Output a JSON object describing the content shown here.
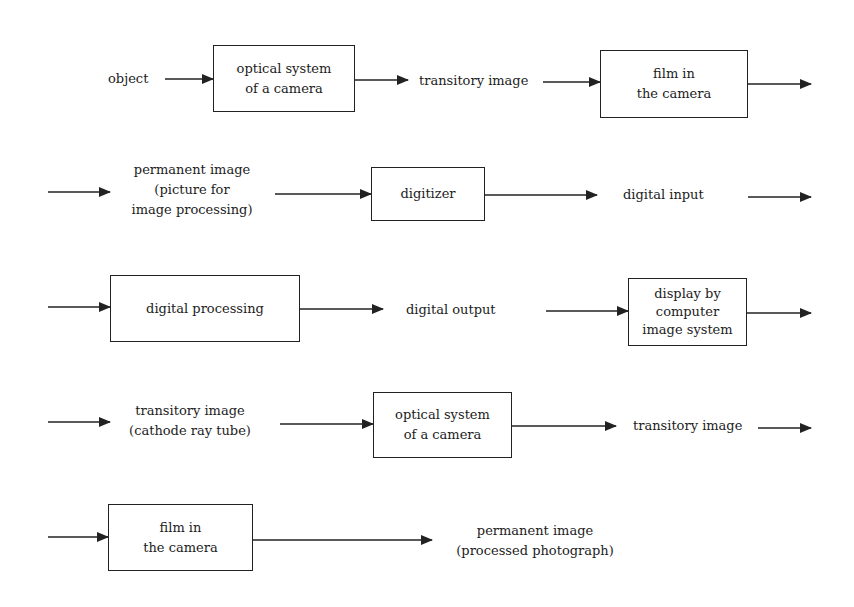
{
  "diagram": {
    "type": "flowchart",
    "rows": [
      {
        "row": 1,
        "nodes": [
          {
            "id": "object",
            "kind": "label",
            "lines": [
              "object"
            ]
          },
          {
            "id": "optical1",
            "kind": "box",
            "lines": [
              "optical system",
              "of a camera"
            ]
          },
          {
            "id": "transitory1",
            "kind": "label",
            "lines": [
              "transitory image"
            ]
          },
          {
            "id": "film1",
            "kind": "box",
            "lines": [
              "film in",
              "the camera"
            ]
          }
        ]
      },
      {
        "row": 2,
        "nodes": [
          {
            "id": "permanent1",
            "kind": "label",
            "lines": [
              "permanent image",
              "(picture for",
              "image processing)"
            ]
          },
          {
            "id": "digitizer",
            "kind": "box",
            "lines": [
              "digitizer"
            ]
          },
          {
            "id": "digital_input",
            "kind": "label",
            "lines": [
              "digital input"
            ]
          }
        ]
      },
      {
        "row": 3,
        "nodes": [
          {
            "id": "digital_processing",
            "kind": "box",
            "lines": [
              "digital processing"
            ]
          },
          {
            "id": "digital_output",
            "kind": "label",
            "lines": [
              "digital output"
            ]
          },
          {
            "id": "display",
            "kind": "box",
            "lines": [
              "display by",
              "computer",
              "image system"
            ]
          }
        ]
      },
      {
        "row": 4,
        "nodes": [
          {
            "id": "transitory2",
            "kind": "label",
            "lines": [
              "transitory image",
              "(cathode ray tube)"
            ]
          },
          {
            "id": "optical2",
            "kind": "box",
            "lines": [
              "optical system",
              "of a camera"
            ]
          },
          {
            "id": "transitory3",
            "kind": "label",
            "lines": [
              "transitory image"
            ]
          }
        ]
      },
      {
        "row": 5,
        "nodes": [
          {
            "id": "film2",
            "kind": "box",
            "lines": [
              "film in",
              "the camera"
            ]
          },
          {
            "id": "permanent2",
            "kind": "label",
            "lines": [
              "permanent image",
              "(processed photograph)"
            ]
          }
        ]
      }
    ],
    "edges": [
      [
        "object",
        "optical1"
      ],
      [
        "optical1",
        "transitory1"
      ],
      [
        "transitory1",
        "film1"
      ],
      [
        "film1",
        "permanent1"
      ],
      [
        "permanent1",
        "digitizer"
      ],
      [
        "digitizer",
        "digital_input"
      ],
      [
        "digital_input",
        "digital_processing"
      ],
      [
        "digital_processing",
        "digital_output"
      ],
      [
        "digital_output",
        "display"
      ],
      [
        "display",
        "transitory2"
      ],
      [
        "transitory2",
        "optical2"
      ],
      [
        "optical2",
        "transitory3"
      ],
      [
        "transitory3",
        "film2"
      ],
      [
        "film2",
        "permanent2"
      ]
    ]
  },
  "text": {
    "object": "object",
    "optical1_l1": "optical system",
    "optical1_l2": "of a camera",
    "transitory1": "transitory image",
    "film1_l1": "film in",
    "film1_l2": "the camera",
    "permanent1_l1": "permanent image",
    "permanent1_l2": "(picture for",
    "permanent1_l3": "image processing)",
    "digitizer": "digitizer",
    "digital_input": "digital input",
    "digital_processing": "digital processing",
    "digital_output": "digital output",
    "display_l1": "display by",
    "display_l2": "computer",
    "display_l3": "image system",
    "transitory2_l1": "transitory image",
    "transitory2_l2": "(cathode ray tube)",
    "optical2_l1": "optical system",
    "optical2_l2": "of a camera",
    "transitory3": "transitory image",
    "film2_l1": "film in",
    "film2_l2": "the camera",
    "permanent2_l1": "permanent image",
    "permanent2_l2": "(processed photograph)"
  },
  "colors": {
    "line": "#222222",
    "text": "#1c1c1c",
    "background": "#ffffff"
  }
}
